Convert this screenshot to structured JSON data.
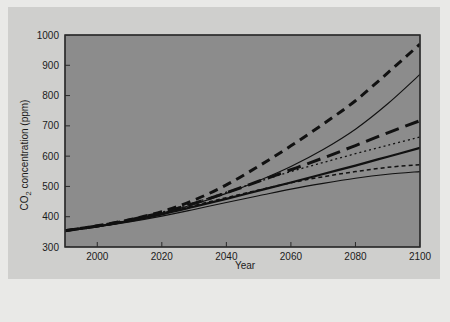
{
  "figure": {
    "background_color": "#cfcfcd",
    "plot_background_color": "#8c8c8c",
    "page_background_color": "#e9e9e7",
    "axis_color": "#2a2a2a",
    "line_color": "#111111"
  },
  "axes": {
    "x_title": "Year",
    "y_title_main": "CO",
    "y_title_sub": "2",
    "y_title_rest": " concentration (ppm)",
    "x_ticks": [
      "2000",
      "2020",
      "2040",
      "2060",
      "2080",
      "2100"
    ],
    "y_ticks": [
      "300",
      "400",
      "500",
      "600",
      "700",
      "800",
      "900",
      "1000"
    ]
  },
  "chart_data": {
    "type": "line",
    "title": "",
    "xlabel": "Year",
    "ylabel": "CO2 concentration (ppm)",
    "xlim": [
      1990,
      2100
    ],
    "ylim": [
      300,
      1000
    ],
    "xticks": [
      2000,
      2020,
      2040,
      2060,
      2080,
      2100
    ],
    "yticks": [
      300,
      400,
      500,
      600,
      700,
      800,
      900,
      1000
    ],
    "grid": false,
    "legend": "none",
    "x": [
      1990,
      2000,
      2010,
      2020,
      2030,
      2040,
      2050,
      2060,
      2070,
      2080,
      2090,
      2100
    ],
    "series": [
      {
        "name": "A1FI",
        "style": "dashed-thick",
        "dash": "9,6",
        "width": 3.0,
        "values": [
          354,
          370,
          390,
          417,
          455,
          505,
          567,
          634,
          706,
          783,
          875,
          970
        ]
      },
      {
        "name": "A2",
        "style": "solid-thin",
        "dash": "",
        "width": 1.1,
        "values": [
          354,
          369,
          388,
          412,
          441,
          477,
          519,
          566,
          622,
          689,
          773,
          870
        ]
      },
      {
        "name": "A1B",
        "style": "dashed-thick-long",
        "dash": "14,7",
        "width": 3.0,
        "values": [
          354,
          369,
          389,
          414,
          444,
          479,
          517,
          555,
          594,
          635,
          677,
          717
        ]
      },
      {
        "name": "A1T",
        "style": "dotted-thin",
        "dash": "2,3",
        "width": 1.3,
        "values": [
          354,
          369,
          389,
          415,
          446,
          481,
          516,
          549,
          579,
          608,
          636,
          663
        ]
      },
      {
        "name": "B2",
        "style": "solid-thick",
        "dash": "",
        "width": 2.3,
        "values": [
          354,
          368,
          386,
          408,
          433,
          459,
          486,
          513,
          541,
          569,
          598,
          627
        ]
      },
      {
        "name": "B1",
        "style": "dashed-thin-short",
        "dash": "4,3",
        "width": 1.5,
        "values": [
          354,
          368,
          387,
          410,
          437,
          463,
          488,
          512,
          532,
          549,
          563,
          572
        ]
      },
      {
        "name": "B1-low",
        "style": "solid-thin-flat",
        "dash": "",
        "width": 1.1,
        "values": [
          354,
          367,
          383,
          402,
          424,
          447,
          469,
          491,
          510,
          527,
          540,
          549
        ]
      }
    ]
  }
}
